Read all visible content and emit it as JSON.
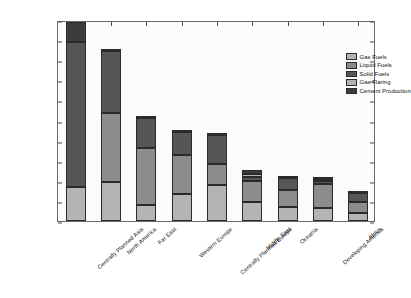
{
  "chart_data": {
    "type": "bar",
    "subtype": "stacked-bar",
    "title": "",
    "xlabel": "",
    "ylabel": "Million metric tons of carbon",
    "ylim": [
      0,
      2000
    ],
    "yticks": [
      0,
      200,
      400,
      600,
      800,
      1000,
      1200,
      1400,
      1600,
      1800,
      2000
    ],
    "grid": false,
    "legend_position": "upper right",
    "categories": [
      "Centrally Planned Asia",
      "North America",
      "Far East",
      "Western Europe",
      "Centrally Planned Europe",
      "Middle East",
      "Oceania",
      "Developing America",
      "Africa"
    ],
    "series": [
      {
        "name": "Gas Fuels",
        "color": "#b4b4b4",
        "values": [
          340,
          390,
          155,
          265,
          360,
          190,
          135,
          130,
          75
        ]
      },
      {
        "name": "Liquid Fuels",
        "color": "#8c8c8c",
        "values": [
          0,
          680,
          570,
          390,
          210,
          205,
          175,
          235,
          110
        ]
      },
      {
        "name": "Solid Fuels",
        "color": "#565656",
        "values": [
          1440,
          620,
          300,
          230,
          290,
          40,
          120,
          35,
          95
        ]
      },
      {
        "name": "Gas Flaring",
        "color": "#b4b4b4",
        "values": [
          0,
          0,
          0,
          0,
          0,
          35,
          0,
          15,
          0
        ]
      },
      {
        "name": "Cement Production",
        "color": "#3c3c3c",
        "values": [
          200,
          10,
          15,
          20,
          20,
          40,
          10,
          25,
          20
        ]
      }
    ],
    "totals": [
      1980,
      1700,
      1040,
      905,
      880,
      510,
      440,
      440,
      300
    ]
  },
  "legend": {
    "items": [
      {
        "label": "Gas Fuels"
      },
      {
        "label": "Liquid Fuels"
      },
      {
        "label": "Solid Fuels"
      },
      {
        "label": "Gas Flaring"
      },
      {
        "label": "Cement Production"
      }
    ]
  }
}
